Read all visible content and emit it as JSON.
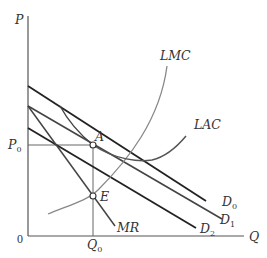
{
  "diagram": {
    "type": "economics-monopolistic-competition-long-run",
    "colors": {
      "axis": "#555555",
      "demand": "#222222",
      "demand_mid": "#444444",
      "cost_curve": "#777777",
      "guide": "#666666",
      "text": "#333333"
    },
    "axes": {
      "y_label": "P",
      "x_label": "Q",
      "origin_label": "0"
    },
    "levels": {
      "price": {
        "label": "P",
        "sub": "0"
      },
      "quantity": {
        "label": "Q",
        "sub": "0"
      }
    },
    "curves": {
      "lmc": {
        "label": "LMC"
      },
      "lac": {
        "label": "LAC"
      },
      "mr": {
        "label": "MR"
      },
      "d0": {
        "label": "D",
        "sub": "0"
      },
      "d1": {
        "label": "D",
        "sub": "1"
      },
      "d2": {
        "label": "D",
        "sub": "2"
      }
    },
    "points": {
      "a": {
        "label": "A"
      },
      "e": {
        "label": "E"
      }
    }
  }
}
